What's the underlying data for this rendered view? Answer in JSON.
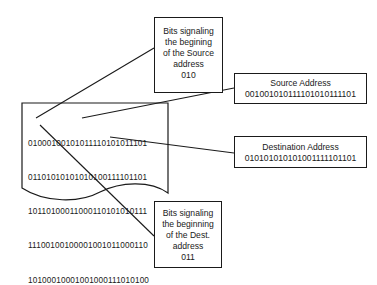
{
  "diagram": {
    "document": {
      "lines": [
        "01000100101011110101011101",
        "01101010101010100111101101",
        "10110100011000110101010111",
        "11100100100001001011000110",
        "10100010001001000111010100"
      ]
    },
    "callouts": {
      "source_start": {
        "lines": [
          "Bits signaling",
          "the begining",
          "of the Source",
          "address",
          "010"
        ]
      },
      "source_address": {
        "title": "Source Address",
        "value": "001001010111101010111101"
      },
      "destination_address": {
        "title": "Destination Address",
        "value": "010101010101001111101101"
      },
      "dest_start": {
        "lines": [
          "Bits signaling",
          "the beginning",
          "of the Dest.",
          "address",
          "011"
        ]
      }
    },
    "colors": {
      "stroke": "#1a1a1a",
      "background": "#ffffff"
    }
  }
}
